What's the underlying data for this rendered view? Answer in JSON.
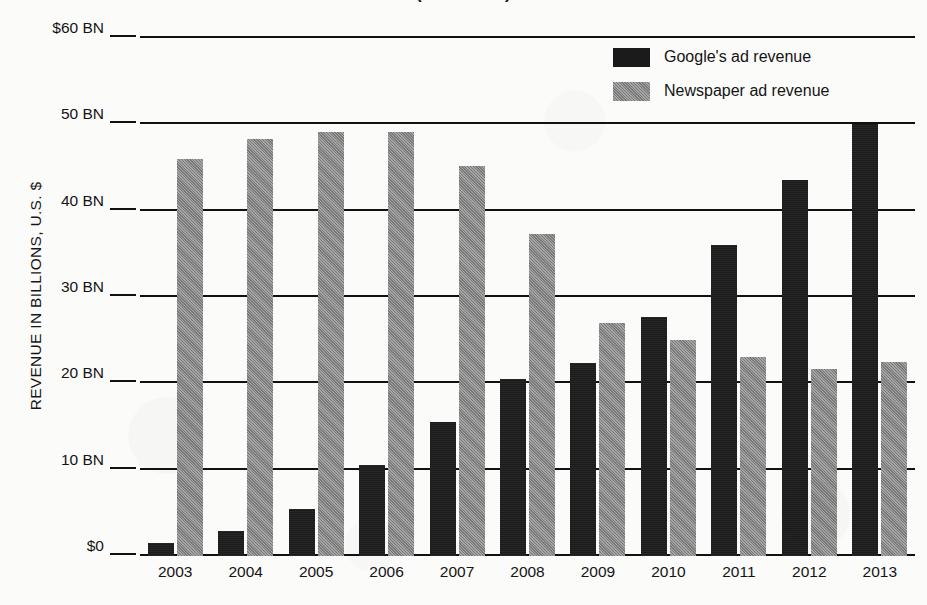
{
  "chart_data": {
    "type": "bar",
    "title": "(2003-2013)",
    "xlabel": "",
    "ylabel": "REVENUE IN BILLIONS, U.S. $",
    "categories": [
      "2003",
      "2004",
      "2005",
      "2006",
      "2007",
      "2008",
      "2009",
      "2010",
      "2011",
      "2012",
      "2013"
    ],
    "series": [
      {
        "name": "Google's ad revenue",
        "color": "#1b1b1b",
        "values": [
          1.5,
          2.9,
          5.5,
          10.5,
          15.5,
          20.5,
          22.3,
          27.7,
          36.0,
          43.5,
          50.0
        ]
      },
      {
        "name": "Newspaper ad revenue",
        "color": "#8b8b8b",
        "values": [
          46.0,
          48.3,
          49.1,
          49.1,
          45.2,
          37.3,
          27.0,
          25.0,
          23.0,
          21.7,
          22.5
        ]
      }
    ],
    "ylim": [
      0,
      60
    ],
    "ytick_values": [
      0,
      10,
      20,
      30,
      40,
      50,
      60
    ],
    "ytick_labels": [
      "$0",
      "10 BN",
      "20 BN",
      "30 BN",
      "40 BN",
      "50 BN",
      "$60 BN"
    ],
    "grid": true,
    "legend_position": "top-right"
  },
  "legend": {
    "items": [
      {
        "label": "Google's ad revenue",
        "swatch": "google"
      },
      {
        "label": "Newspaper ad revenue",
        "swatch": "news"
      }
    ]
  }
}
